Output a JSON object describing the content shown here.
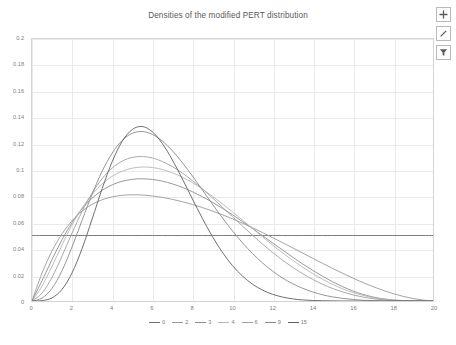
{
  "chart_data": {
    "type": "line",
    "title": "Densities of the modified PERT distribution",
    "xlabel": "",
    "ylabel": "",
    "xlim": [
      0,
      20
    ],
    "ylim": [
      0,
      0.2
    ],
    "grid": true,
    "legend_position": "bottom",
    "xticks": [
      "0",
      "2",
      "4",
      "6",
      "8",
      "10",
      "12",
      "14",
      "16",
      "18",
      "20"
    ],
    "yticks": [
      "0",
      "0.02",
      "0.04",
      "0.06",
      "0.08",
      "0.1",
      "0.12",
      "0.14",
      "0.16",
      "0.18",
      "0.2"
    ],
    "x": [
      0,
      0.5,
      1,
      1.5,
      2,
      2.5,
      3,
      3.5,
      4,
      4.5,
      5,
      5.5,
      6,
      6.5,
      7,
      7.5,
      8,
      8.5,
      9,
      9.5,
      10,
      10.5,
      11,
      11.5,
      12,
      12.5,
      13,
      13.5,
      14,
      14.5,
      15,
      15.5,
      16,
      16.5,
      17,
      17.5,
      18,
      18.5,
      19,
      19.5,
      20
    ],
    "series": [
      {
        "name": "0",
        "color": "#6f6f6f",
        "peak_x": null,
        "peak_y": 0.05,
        "values": [
          0.05,
          0.05,
          0.05,
          0.05,
          0.05,
          0.05,
          0.05,
          0.05,
          0.05,
          0.05,
          0.05,
          0.05,
          0.05,
          0.05,
          0.05,
          0.05,
          0.05,
          0.05,
          0.05,
          0.05,
          0.05,
          0.05,
          0.05,
          0.05,
          0.05,
          0.05,
          0.05,
          0.05,
          0.05,
          0.05,
          0.05,
          0.05,
          0.05,
          0.05,
          0.05,
          0.05,
          0.05,
          0.05,
          0.05,
          0.05,
          0.05
        ]
      },
      {
        "name": "2",
        "color": "#9a9a9a",
        "peak_x": 5.2,
        "peak_y": 0.081,
        "values": [
          0.0,
          0.0213,
          0.0382,
          0.0513,
          0.0613,
          0.0686,
          0.0738,
          0.0773,
          0.0795,
          0.0807,
          0.0811,
          0.0809,
          0.0802,
          0.0791,
          0.0776,
          0.0758,
          0.0737,
          0.0713,
          0.0687,
          0.0658,
          0.0627,
          0.0594,
          0.0559,
          0.0522,
          0.0484,
          0.0445,
          0.0406,
          0.0366,
          0.0326,
          0.0287,
          0.0248,
          0.0211,
          0.0175,
          0.0141,
          0.011,
          0.0082,
          0.0057,
          0.0036,
          0.0019,
          0.0007,
          0.0
        ]
      },
      {
        "name": "3",
        "color": "#8d8d8d",
        "peak_x": 5.1,
        "peak_y": 0.0935,
        "values": [
          0.0,
          0.0155,
          0.0317,
          0.0468,
          0.0599,
          0.0704,
          0.0785,
          0.0845,
          0.0887,
          0.0914,
          0.0929,
          0.0933,
          0.0928,
          0.0915,
          0.0894,
          0.0867,
          0.0834,
          0.0796,
          0.0754,
          0.0707,
          0.0658,
          0.0606,
          0.0553,
          0.0498,
          0.0443,
          0.0389,
          0.0335,
          0.0283,
          0.0234,
          0.0188,
          0.0146,
          0.0109,
          0.0077,
          0.0051,
          0.0031,
          0.0017,
          0.0008,
          0.0003,
          0.0001,
          0.0,
          0.0
        ]
      },
      {
        "name": "4",
        "color": "#b5b5b5",
        "peak_x": 5.1,
        "peak_y": 0.105,
        "values": [
          0.0,
          0.0114,
          0.0265,
          0.0428,
          0.0581,
          0.0711,
          0.0814,
          0.0894,
          0.0952,
          0.0991,
          0.1014,
          0.1023,
          0.1019,
          0.1004,
          0.0979,
          0.0945,
          0.0903,
          0.0854,
          0.08,
          0.0742,
          0.068,
          0.0617,
          0.0553,
          0.0489,
          0.0427,
          0.0367,
          0.0311,
          0.0258,
          0.0209,
          0.0165,
          0.0126,
          0.0093,
          0.0065,
          0.0043,
          0.0026,
          0.0014,
          0.0007,
          0.0002,
          0.0,
          0.0,
          0.0
        ]
      },
      {
        "name": "6",
        "color": "#9f9f9f",
        "peak_x": 5.05,
        "peak_y": 0.1215,
        "values": [
          0.0,
          0.0061,
          0.0181,
          0.0344,
          0.0519,
          0.0684,
          0.0824,
          0.0934,
          0.1015,
          0.1068,
          0.1096,
          0.1103,
          0.1092,
          0.1065,
          0.1026,
          0.0977,
          0.0919,
          0.0855,
          0.0787,
          0.0716,
          0.0644,
          0.0572,
          0.0502,
          0.0434,
          0.037,
          0.0311,
          0.0257,
          0.0208,
          0.0165,
          0.0127,
          0.0095,
          0.0069,
          0.0047,
          0.003,
          0.0018,
          0.0009,
          0.0004,
          0.0001,
          0.0,
          0.0,
          0.0
        ]
      },
      {
        "name": "9",
        "color": "#8a8a8a",
        "peak_x": 5.0,
        "peak_y": 0.147,
        "values": [
          0.0,
          0.0022,
          0.0097,
          0.0232,
          0.0414,
          0.0617,
          0.0816,
          0.0991,
          0.1129,
          0.1226,
          0.128,
          0.1294,
          0.1272,
          0.1221,
          0.1147,
          0.1056,
          0.0954,
          0.0847,
          0.0739,
          0.0634,
          0.0535,
          0.0444,
          0.0362,
          0.029,
          0.0228,
          0.0175,
          0.0132,
          0.0097,
          0.0069,
          0.0047,
          0.0031,
          0.002,
          0.0012,
          0.0006,
          0.0003,
          0.0001,
          0.0,
          0.0,
          0.0,
          0.0,
          0.0
        ]
      },
      {
        "name": "15",
        "color": "#5f5f5f",
        "peak_x": 5.0,
        "peak_y": 0.185,
        "values": [
          0.0,
          0.0003,
          0.0024,
          0.0089,
          0.0215,
          0.0401,
          0.0626,
          0.0858,
          0.1064,
          0.1219,
          0.1309,
          0.1332,
          0.1292,
          0.1202,
          0.1077,
          0.0932,
          0.0779,
          0.063,
          0.0492,
          0.0371,
          0.027,
          0.019,
          0.0128,
          0.0083,
          0.0051,
          0.003,
          0.0016,
          0.0008,
          0.0004,
          0.0002,
          0.0001,
          0.0,
          0.0,
          0.0,
          0.0,
          0.0,
          0.0,
          0.0,
          0.0,
          0.0,
          0.0
        ]
      }
    ]
  },
  "toolbar": {
    "buttons": [
      {
        "name": "add-icon",
        "label": "+"
      },
      {
        "name": "edit-pencil-icon",
        "label": ""
      },
      {
        "name": "filter-funnel-icon",
        "label": ""
      }
    ]
  }
}
